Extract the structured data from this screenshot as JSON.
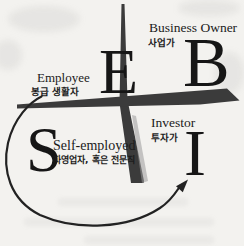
{
  "diagram": {
    "type": "cashflow-quadrant",
    "colors": {
      "background": "#f3f2ef",
      "cross_stroke": "#3b3b3b",
      "cross_highlight": "#9a9a9a",
      "arrow": "#222222",
      "text": "#1b1b1b"
    },
    "quadrants": {
      "employee": {
        "letter": "E",
        "name": "Employee",
        "korean": "봉급 생활자"
      },
      "business_owner": {
        "letter": "B",
        "name": "Business Owner",
        "korean": "사업가"
      },
      "self_employed": {
        "letter": "S",
        "name": "Self-employed",
        "korean": "자영업자, 혹은 전문직"
      },
      "investor": {
        "letter": "I",
        "name": "Investor",
        "korean": "투자가"
      }
    }
  }
}
